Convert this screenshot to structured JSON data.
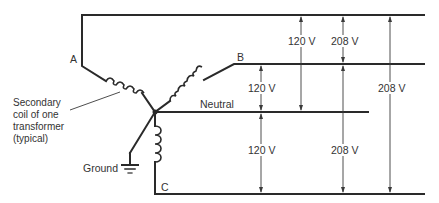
{
  "diagram": {
    "type": "three-phase wye transformer secondary",
    "phase_labels": {
      "a": "A",
      "b": "B",
      "c": "C"
    },
    "neutral_label": "Neutral",
    "ground_label": "Ground",
    "coil_note": "Secondary\ncoil of one\ntransformer\n(typical)",
    "voltages": {
      "a_to_neutral": "120 V",
      "a_to_b": "208 V",
      "b_to_neutral": "120 V",
      "c_to_neutral": "120 V",
      "b_to_c": "208 V",
      "a_to_c": "208 V"
    },
    "colors": {
      "line": "#2a2a2a",
      "text": "#333333",
      "background": "#ffffff"
    }
  }
}
